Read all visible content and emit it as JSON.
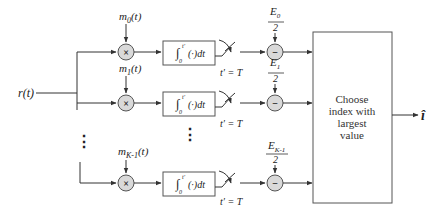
{
  "diagram": {
    "type": "block-diagram",
    "title": "",
    "input": {
      "label": "r(t)"
    },
    "output": {
      "label": "î"
    },
    "branches": [
      {
        "id": 0,
        "reference_signal": "m_0(t)",
        "ref_base": "m",
        "ref_sub": "0",
        "ref_arg": "(t)",
        "integrator": "∫_0^{t'} (·)dt",
        "sample": "t' = T",
        "bias": "E_0 / 2",
        "bias_num": "E",
        "bias_sub": "0",
        "bias_den": "2"
      },
      {
        "id": 1,
        "reference_signal": "m_1(t)",
        "ref_base": "m",
        "ref_sub": "1",
        "ref_arg": "(t)",
        "integrator": "∫_0^{t'} (·)dt",
        "sample": "t' = T",
        "bias": "E_1 / 2",
        "bias_num": "E",
        "bias_sub": "1",
        "bias_den": "2"
      },
      {
        "id": 2,
        "reference_signal": "m_{K-1}(t)",
        "ref_base": "m",
        "ref_sub": "K-1",
        "ref_arg": "(t)",
        "integrator": "∫_0^{t'} (·)dt",
        "sample": "t' = T",
        "bias": "E_{K-1} / 2",
        "bias_num": "E",
        "bias_sub": "K-1",
        "bias_den": "2"
      }
    ],
    "multiplier_symbol": "×",
    "subtractor_symbol": "−",
    "integral_symbol": "∫",
    "integral_lower": "0",
    "integral_upper": "t′",
    "integrand": "(·)dt",
    "sample_label": "t′ = T",
    "ellipsis": "⋮",
    "decision_box": {
      "lines": [
        "Choose",
        "index with",
        "largest",
        "value"
      ]
    },
    "colors": {
      "line": "#333333",
      "node_fill": "#d9d9d9",
      "node_stroke": "#555555",
      "box_stroke": "#555555"
    }
  }
}
